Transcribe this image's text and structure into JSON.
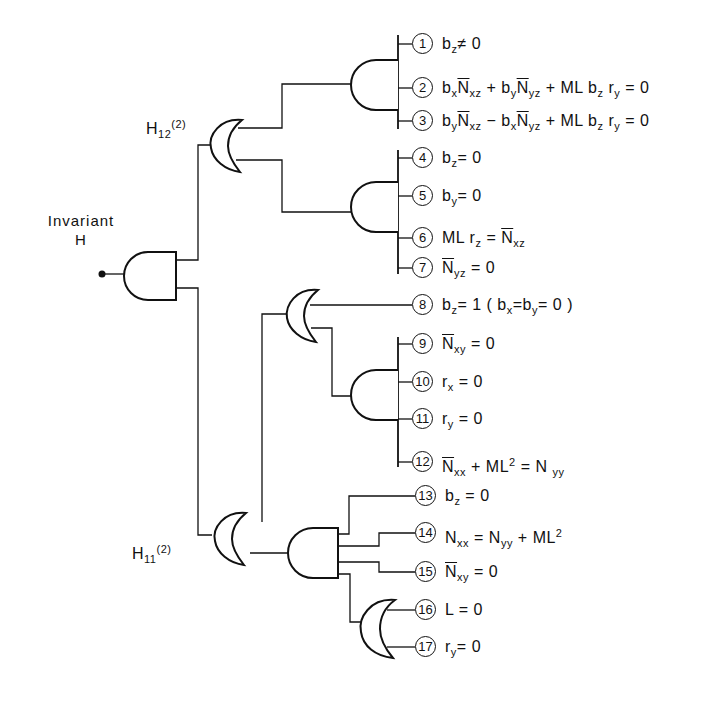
{
  "diagram": {
    "type": "logic-gate tree",
    "root": {
      "title_line1": "Invariant",
      "title_line2": "H",
      "gate": "AND"
    },
    "branches": [
      {
        "label_main": "H",
        "label_sub": "12",
        "label_sup": "(2)",
        "gate": "OR"
      },
      {
        "label_main": "H",
        "label_sub": "11",
        "label_sup": "(2)",
        "gate": "OR"
      }
    ],
    "conditions": [
      {
        "num": "1",
        "text": "b_z ≠ 0"
      },
      {
        "num": "2",
        "text": "b_x N̄_xz + b_y N̄_yz + ML b_z r_y = 0"
      },
      {
        "num": "3",
        "text": "b_y N̄_xz − b_x N̄_yz + ML b_z r_y = 0"
      },
      {
        "num": "4",
        "text": "b_z = 0"
      },
      {
        "num": "5",
        "text": "b_y = 0"
      },
      {
        "num": "6",
        "text": "ML r_z = N̄_xz"
      },
      {
        "num": "7",
        "text": "N̄_yz = 0"
      },
      {
        "num": "8",
        "text": "b_z = 1 (b_x = b_y = 0)"
      },
      {
        "num": "9",
        "text": "N̄_xy = 0"
      },
      {
        "num": "10",
        "text": "r_x = 0"
      },
      {
        "num": "11",
        "text": "r_y = 0"
      },
      {
        "num": "12",
        "text": "N̄_xx + ML² = N_yy"
      },
      {
        "num": "13",
        "text": "b_z = 0"
      },
      {
        "num": "14",
        "text": "N_xx = N_yy + ML²"
      },
      {
        "num": "15",
        "text": "N̄_xy = 0"
      },
      {
        "num": "16",
        "text": "L = 0"
      },
      {
        "num": "17",
        "text": "r_y = 0"
      }
    ],
    "parts": {
      "zero": "0",
      "neq": "≠",
      "eq": "=",
      "plus": "+",
      "minus": "−",
      "b": "b",
      "N": "N",
      "r": "r",
      "L": "L",
      "ML": "ML",
      "one": "1",
      "lp": "(",
      "rp": ")",
      "two": "2",
      "x": "x",
      "y": "y",
      "z": "z",
      "xz": "xz",
      "yz": "yz",
      "xy": "xy",
      "xx": "xx",
      "yy": "yy"
    }
  }
}
